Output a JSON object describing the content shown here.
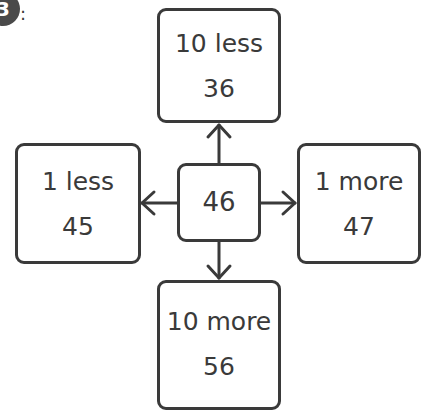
{
  "question": {
    "number": "3",
    "separator": ":"
  },
  "diagram": {
    "center": {
      "value": "46"
    },
    "top": {
      "label": "10 less",
      "value": "36"
    },
    "left": {
      "label": "1 less",
      "value": "45"
    },
    "right": {
      "label": "1 more",
      "value": "47"
    },
    "bottom": {
      "label": "10 more",
      "value": "56"
    }
  },
  "colors": {
    "stroke": "#3a3a3a",
    "badge": "#4a4a4a",
    "background": "#ffffff"
  }
}
